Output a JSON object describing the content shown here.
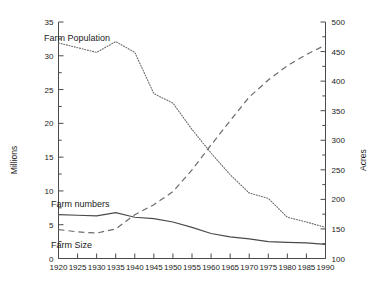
{
  "chart_data": {
    "type": "line",
    "title": "",
    "subtitle": "",
    "xlabel": "",
    "ylabel": "Millions",
    "y2label": "Acres",
    "grid": false,
    "legend_position": "inline-annotations",
    "x": [
      1920,
      1925,
      1930,
      1935,
      1940,
      1945,
      1950,
      1955,
      1960,
      1965,
      1970,
      1975,
      1980,
      1985,
      1990
    ],
    "xlim": [
      1920,
      1990
    ],
    "xticks": [
      "1920",
      "1925",
      "1930",
      "1935",
      "1940",
      "1945",
      "1950",
      "1955",
      "1960",
      "1965",
      "1970",
      "1975",
      "1980",
      "1985",
      "1990"
    ],
    "ylim": [
      0,
      35
    ],
    "yticks": [
      "0",
      "5",
      "10",
      "15",
      "20",
      "25",
      "30",
      "35"
    ],
    "y2lim": [
      100,
      500
    ],
    "y2ticks": [
      "100",
      "150",
      "200",
      "250",
      "300",
      "350",
      "400",
      "450",
      "500"
    ],
    "series": [
      {
        "name": "Farm Population",
        "axis": "left",
        "style": "dotted",
        "units": "Millions",
        "values": [
          31.9,
          31.2,
          30.5,
          32.1,
          30.5,
          24.4,
          23.0,
          19.1,
          15.6,
          12.4,
          9.7,
          8.9,
          6.1,
          5.4,
          4.6
        ]
      },
      {
        "name": "Farm numbers",
        "axis": "left",
        "style": "solid",
        "units": "Millions",
        "values": [
          6.5,
          6.4,
          6.3,
          6.8,
          6.1,
          5.9,
          5.4,
          4.6,
          3.7,
          3.2,
          2.9,
          2.5,
          2.4,
          2.3,
          2.1
        ]
      },
      {
        "name": "Farm Size",
        "axis": "right",
        "style": "dashed",
        "units": "Acres",
        "values": [
          149,
          145,
          143,
          150,
          174,
          191,
          213,
          250,
          292,
          333,
          373,
          402,
          426,
          445,
          461
        ]
      }
    ],
    "annotations": [
      {
        "text": "Farm Population",
        "series": "Farm Population"
      },
      {
        "text": "Farm numbers",
        "series": "Farm numbers"
      },
      {
        "text": "Farm Size",
        "series": "Farm Size"
      }
    ]
  }
}
